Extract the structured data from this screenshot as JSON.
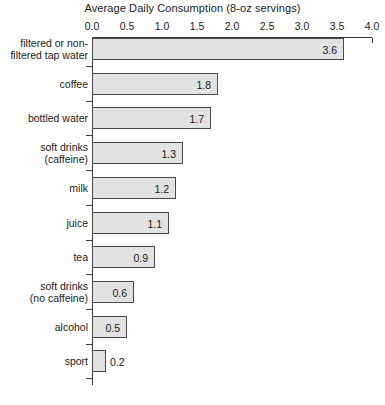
{
  "chart_data": {
    "type": "bar",
    "orientation": "horizontal",
    "title": "Average Daily Consumption (8-oz servings)",
    "xlabel": "",
    "ylabel": "",
    "xlim": [
      0.0,
      4.0
    ],
    "xticks": [
      "0.0",
      "0.5",
      "1.0",
      "1.5",
      "2.0",
      "2.5",
      "3.0",
      "3.5",
      "4.0"
    ],
    "xtick_values": [
      0.0,
      0.5,
      1.0,
      1.5,
      2.0,
      2.5,
      3.0,
      3.5,
      4.0
    ],
    "grid": false,
    "legend": null,
    "categories": [
      "filtered or non-filtered tap water",
      "coffee",
      "bottled water",
      "soft drinks (caffeine)",
      "milk",
      "juice",
      "tea",
      "soft drinks (no caffeine)",
      "alcohol",
      "sport"
    ],
    "values": [
      3.6,
      1.8,
      1.7,
      1.3,
      1.2,
      1.1,
      0.9,
      0.6,
      0.5,
      0.2
    ],
    "data_labels": [
      "3.6",
      "1.8",
      "1.7",
      "1.3",
      "1.2",
      "1.1",
      "0.9",
      "0.6",
      "0.5",
      "0.2"
    ],
    "bar_fill_color": "#e2e2e2",
    "bar_border_color": "#4a4a4a",
    "axis_color": "#3a3a3a",
    "text_color": "#1a1a1a"
  },
  "rows": [
    {
      "label_lines": [
        "filtered or non-",
        "filtered tap water"
      ],
      "value": 3.6,
      "data_label": "3.6",
      "label_inside": true
    },
    {
      "label_lines": [
        "coffee"
      ],
      "value": 1.8,
      "data_label": "1.8",
      "label_inside": true
    },
    {
      "label_lines": [
        "bottled water"
      ],
      "value": 1.7,
      "data_label": "1.7",
      "label_inside": true
    },
    {
      "label_lines": [
        "soft drinks",
        "(caffeine)"
      ],
      "value": 1.3,
      "data_label": "1.3",
      "label_inside": true
    },
    {
      "label_lines": [
        "milk"
      ],
      "value": 1.2,
      "data_label": "1.2",
      "label_inside": true
    },
    {
      "label_lines": [
        "juice"
      ],
      "value": 1.1,
      "data_label": "1.1",
      "label_inside": true
    },
    {
      "label_lines": [
        "tea"
      ],
      "value": 0.9,
      "data_label": "0.9",
      "label_inside": true
    },
    {
      "label_lines": [
        "soft drinks",
        "(no caffeine)"
      ],
      "value": 0.6,
      "data_label": "0.6",
      "label_inside": true
    },
    {
      "label_lines": [
        "alcohol"
      ],
      "value": 0.5,
      "data_label": "0.5",
      "label_inside": true
    },
    {
      "label_lines": [
        "sport"
      ],
      "value": 0.2,
      "data_label": "0.2",
      "label_inside": false
    }
  ]
}
